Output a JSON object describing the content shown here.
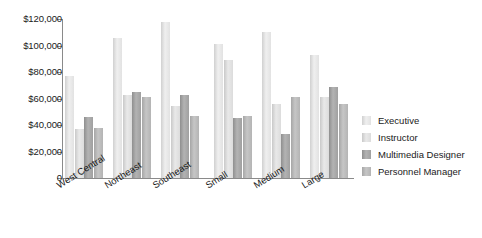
{
  "chart_data": {
    "type": "bar",
    "title": "",
    "subtitle": "",
    "xlabel": "",
    "ylabel": "",
    "ylim": [
      0,
      120000
    ],
    "grid": false,
    "legend_position": "right",
    "axis_tick_labels": [
      "$120,000",
      "$100,000",
      "$80,000",
      "$60,000",
      "$40,000",
      "$20,000",
      "0"
    ],
    "axis_tick_values": [
      120000,
      100000,
      80000,
      60000,
      40000,
      20000,
      0
    ],
    "categories": [
      "West Central",
      "Northeast",
      "Southeast",
      "Small",
      "Medium",
      "Large"
    ],
    "series": [
      {
        "name": "Executive",
        "color": "#e2e2e2",
        "values": [
          77000,
          106000,
          118000,
          101000,
          110000,
          93000
        ]
      },
      {
        "name": "Instructor",
        "color": "#dcdcdc",
        "values": [
          37000,
          63000,
          54000,
          89000,
          56000,
          61000
        ]
      },
      {
        "name": "Multimedia Designer",
        "color": "#a0a0a0",
        "values": [
          46000,
          65000,
          63000,
          45000,
          33000,
          69000
        ]
      },
      {
        "name": "Personnel Manager",
        "color": "#b4b4b4",
        "values": [
          38000,
          61000,
          47000,
          47000,
          61000,
          56000
        ]
      }
    ]
  },
  "legend": {
    "items": [
      {
        "label": "Executive"
      },
      {
        "label": "Instructor"
      },
      {
        "label": "Multimedia Designer"
      },
      {
        "label": "Personnel Manager"
      }
    ]
  }
}
